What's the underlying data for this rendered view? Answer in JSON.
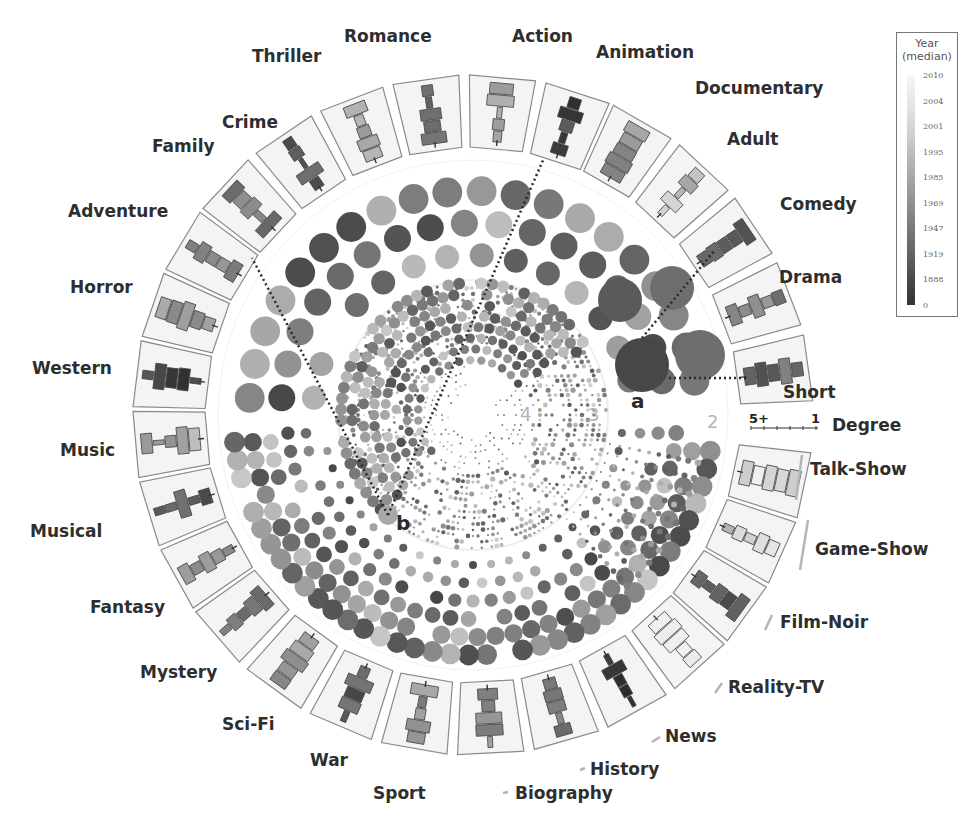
{
  "chart_data": {
    "type": "radial-network-bubble",
    "title": "",
    "center": [
      473,
      415
    ],
    "genres_clockwise_from_right": [
      {
        "name": "Talk-Show",
        "median_year_shade": "light",
        "notes": "small, outlined"
      },
      {
        "name": "Game-Show",
        "median_year_shade": "light"
      },
      {
        "name": "Film-Noir",
        "median_year_shade": "dark (1947)"
      },
      {
        "name": "Reality-TV",
        "median_year_shade": "light (2010)"
      },
      {
        "name": "News",
        "median_year_shade": "very dark"
      },
      {
        "name": "History",
        "median_year_shade": "medium"
      },
      {
        "name": "Biography",
        "median_year_shade": "medium"
      },
      {
        "name": "Sport",
        "median_year_shade": "medium"
      },
      {
        "name": "War",
        "median_year_shade": "dark"
      },
      {
        "name": "Sci-Fi",
        "median_year_shade": "medium-light"
      },
      {
        "name": "Mystery",
        "median_year_shade": "dark-medium"
      },
      {
        "name": "Fantasy",
        "median_year_shade": "medium-light"
      },
      {
        "name": "Musical",
        "median_year_shade": "dark"
      },
      {
        "name": "Music",
        "median_year_shade": "light"
      },
      {
        "name": "Western",
        "median_year_shade": "very dark"
      },
      {
        "name": "Horror",
        "median_year_shade": "medium-light"
      },
      {
        "name": "Adventure",
        "median_year_shade": "medium"
      },
      {
        "name": "Family",
        "median_year_shade": "medium"
      },
      {
        "name": "Crime",
        "median_year_shade": "dark"
      },
      {
        "name": "Thriller",
        "median_year_shade": "light"
      },
      {
        "name": "Romance",
        "median_year_shade": "dark"
      },
      {
        "name": "Action",
        "median_year_shade": "light"
      },
      {
        "name": "Animation",
        "median_year_shade": "very dark"
      },
      {
        "name": "Documentary",
        "median_year_shade": "medium-light"
      },
      {
        "name": "Adult",
        "median_year_shade": "light"
      },
      {
        "name": "Comedy",
        "median_year_shade": "dark"
      },
      {
        "name": "Drama",
        "median_year_shade": "medium"
      },
      {
        "name": "Short",
        "median_year_shade": "dark"
      }
    ],
    "legend": {
      "title": "Year (median)",
      "ticks": [
        "2010",
        "2004",
        "2001",
        "1995",
        "1985",
        "1969",
        "1947",
        "1919",
        "1888",
        "0"
      ]
    },
    "degree_axis": {
      "label": "Degree",
      "left": "5+",
      "right": "1"
    },
    "ring_numbers": [
      "4",
      "3",
      "2"
    ],
    "annotations": [
      "a",
      "b"
    ]
  },
  "labels": {
    "legend_title_1": "Year",
    "legend_title_2": "(median)",
    "degree": "Degree",
    "deg_left": "5+",
    "deg_right": "1",
    "ring4": "4",
    "ring3": "3",
    "ring2": "2",
    "ann_a": "a",
    "ann_b": "b"
  }
}
